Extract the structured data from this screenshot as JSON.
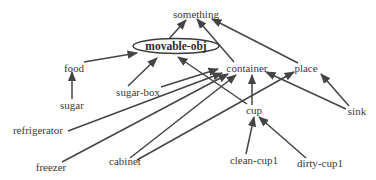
{
  "diagram": {
    "type": "semantic-hierarchy",
    "colors": {
      "line": "#444444",
      "text": "#3a3a3a",
      "background": "#ffffff"
    },
    "highlighted_node": "movable-obj",
    "nodes": [
      {
        "id": "something",
        "label": "something",
        "x": 196,
        "y": 18
      },
      {
        "id": "movable-obj",
        "label": "movable-obj",
        "x": 176,
        "y": 50,
        "shape": "ellipse"
      },
      {
        "id": "food",
        "label": "food",
        "x": 74,
        "y": 72
      },
      {
        "id": "sugar",
        "label": "sugar",
        "x": 72,
        "y": 109
      },
      {
        "id": "sugar-box",
        "label": "sugar-box",
        "x": 138,
        "y": 96
      },
      {
        "id": "container",
        "label": "container",
        "x": 247,
        "y": 72
      },
      {
        "id": "place",
        "label": "place",
        "x": 306,
        "y": 72
      },
      {
        "id": "refrigerator",
        "label": "refrigerator",
        "x": 38,
        "y": 134
      },
      {
        "id": "sink",
        "label": "sink",
        "x": 357,
        "y": 115
      },
      {
        "id": "cup",
        "label": "cup",
        "x": 254,
        "y": 114
      },
      {
        "id": "freezer",
        "label": "freezer",
        "x": 51,
        "y": 171
      },
      {
        "id": "cabinet",
        "label": "cabinet",
        "x": 125,
        "y": 165
      },
      {
        "id": "clean-cup1",
        "label": "clean-cup1",
        "x": 254,
        "y": 164
      },
      {
        "id": "dirty-cup1",
        "label": "dirty-cup1",
        "x": 320,
        "y": 167
      }
    ],
    "edges": [
      {
        "from": "movable-obj",
        "to": "something"
      },
      {
        "from": "container",
        "to": "something"
      },
      {
        "from": "place",
        "to": "something"
      },
      {
        "from": "food",
        "to": "movable-obj"
      },
      {
        "from": "sugar",
        "to": "food"
      },
      {
        "from": "sugar-box",
        "to": "movable-obj"
      },
      {
        "from": "cup",
        "to": "movable-obj"
      },
      {
        "from": "sugar-box",
        "to": "container"
      },
      {
        "from": "refrigerator",
        "to": "container"
      },
      {
        "from": "freezer",
        "to": "container"
      },
      {
        "from": "cabinet",
        "to": "container"
      },
      {
        "from": "cabinet",
        "to": "place"
      },
      {
        "from": "cup",
        "to": "container"
      },
      {
        "from": "sink",
        "to": "container"
      },
      {
        "from": "sink",
        "to": "place"
      },
      {
        "from": "clean-cup1",
        "to": "cup"
      },
      {
        "from": "dirty-cup1",
        "to": "cup"
      }
    ]
  }
}
